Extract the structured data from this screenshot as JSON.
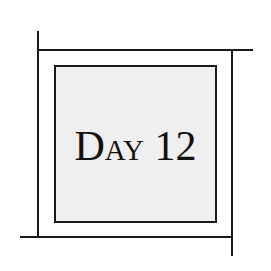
{
  "label": {
    "text": "Day 12"
  },
  "colors": {
    "line": "#1a1a1a",
    "box_fill": "#efefef",
    "background": "#ffffff",
    "text": "#111111"
  }
}
